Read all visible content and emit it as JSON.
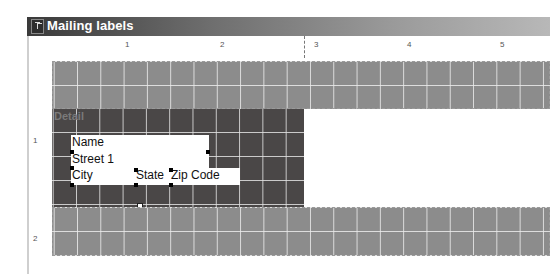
{
  "window": {
    "title": "Mailing labels",
    "icon": "report-designer-icon"
  },
  "ruler": {
    "horizontal_ticks": [
      "1",
      "2",
      "3",
      "4",
      "5"
    ],
    "vertical_ticks": [
      "1",
      "2"
    ]
  },
  "bands": [
    {
      "name": "page-header",
      "label": ""
    },
    {
      "name": "detail",
      "label": "Detail"
    },
    {
      "name": "page-footer",
      "label": ""
    }
  ],
  "fields": {
    "name": "Name",
    "street": "Street 1",
    "city": "City",
    "state": "State",
    "zip": "Zip Code"
  },
  "colors": {
    "titlebar_dark": "#3a3a3a",
    "band_light": "#8c8c8c",
    "band_dark": "#4a4747",
    "field_bg": "#ffffff"
  }
}
